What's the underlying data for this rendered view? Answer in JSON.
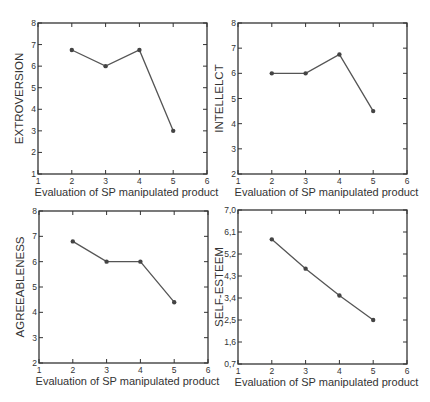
{
  "chart_data": [
    {
      "type": "line",
      "title": "",
      "xlabel": "Evaluation of SP manipulated product",
      "ylabel": "EXTROVERSION",
      "x": [
        2,
        3,
        4,
        5
      ],
      "series": [
        {
          "name": "EXTROVERSION",
          "values": [
            6.75,
            6.0,
            6.75,
            3.0
          ]
        }
      ],
      "xlim": [
        1,
        6
      ],
      "ylim": [
        1,
        8
      ],
      "xticks": [
        "1",
        "2",
        "3",
        "4",
        "5",
        "6"
      ],
      "yticks": [
        "1",
        "2",
        "3",
        "4",
        "5",
        "6",
        "7",
        "8"
      ],
      "grid": false,
      "legend": "none"
    },
    {
      "type": "line",
      "title": "",
      "xlabel": "Evaluation of SP manipulated product",
      "ylabel": "INTELLELCT",
      "x": [
        2,
        3,
        4,
        5
      ],
      "series": [
        {
          "name": "INTELLELCT",
          "values": [
            6.0,
            6.0,
            6.75,
            4.5
          ]
        }
      ],
      "xlim": [
        1,
        6
      ],
      "ylim": [
        2,
        8
      ],
      "xticks": [
        "1",
        "2",
        "3",
        "4",
        "5",
        "6"
      ],
      "yticks": [
        "2",
        "3",
        "4",
        "5",
        "6",
        "7",
        "8"
      ],
      "grid": false,
      "legend": "none"
    },
    {
      "type": "line",
      "title": "",
      "xlabel": "Evaluation of SP manipulated product",
      "ylabel": "AGREEABLENESS",
      "x": [
        2,
        3,
        4,
        5
      ],
      "series": [
        {
          "name": "AGREEABLENESS",
          "values": [
            6.8,
            6.0,
            6.0,
            4.4
          ]
        }
      ],
      "xlim": [
        1,
        6
      ],
      "ylim": [
        2,
        8
      ],
      "xticks": [
        "1",
        "2",
        "3",
        "4",
        "5",
        "6"
      ],
      "yticks": [
        "2",
        "3",
        "4",
        "5",
        "6",
        "7",
        "8"
      ],
      "grid": false,
      "legend": "none"
    },
    {
      "type": "line",
      "title": "",
      "xlabel": "Evaluation of SP manipulated product",
      "ylabel": "SELF-ESTEEM",
      "x": [
        2,
        3,
        4,
        5
      ],
      "series": [
        {
          "name": "SELF-ESTEEM",
          "values": [
            5.8,
            4.6,
            3.5,
            2.5
          ]
        }
      ],
      "xlim": [
        1,
        6
      ],
      "ylim": [
        0.7,
        7.0
      ],
      "xticks": [
        "1",
        "2",
        "3",
        "4",
        "5",
        "6"
      ],
      "yticks": [
        "0,7",
        "1,6",
        "2,5",
        "3,4",
        "4,3",
        "5,2",
        "6,1",
        "7,0"
      ],
      "grid": false,
      "legend": "none"
    }
  ],
  "style": {
    "line_color": "#555555",
    "marker_color": "#444444",
    "axis_color": "#333333"
  },
  "layout": [
    {
      "left": 38,
      "top": 23,
      "right": 207,
      "bottom": 174
    },
    {
      "left": 238,
      "top": 23,
      "right": 407,
      "bottom": 174
    },
    {
      "left": 39,
      "top": 211,
      "right": 208,
      "bottom": 363
    },
    {
      "left": 238,
      "top": 210,
      "right": 407,
      "bottom": 364
    }
  ]
}
